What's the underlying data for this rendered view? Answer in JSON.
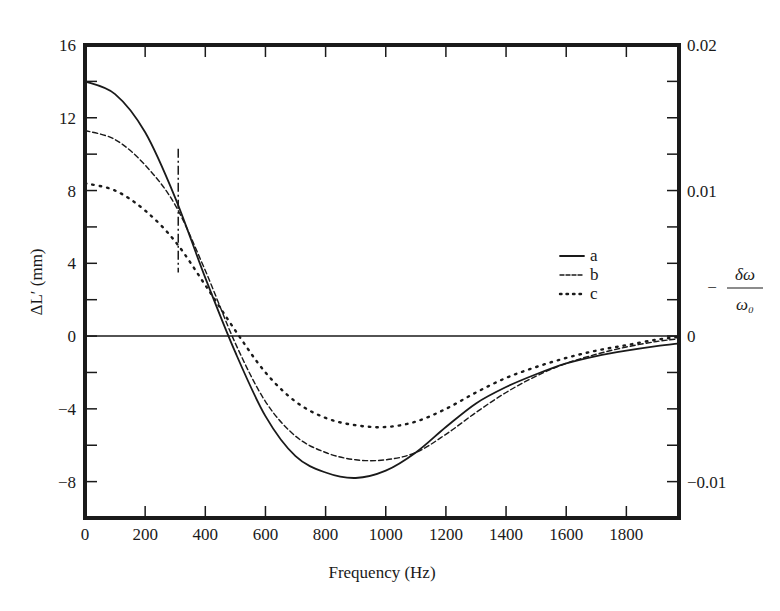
{
  "chart_data": {
    "type": "line",
    "title": "",
    "xlabel": "Frequency (Hz)",
    "ylabel": "ΔL′ (mm)",
    "ylabel_right": "−δω/ω₀",
    "ylabel_right_parts": {
      "sign": "−",
      "numerator": "δω",
      "denominator": "ω₀"
    },
    "xlim": [
      0,
      1975
    ],
    "ylim": [
      -10,
      16
    ],
    "ylim_right": [
      -0.0125,
      0.02
    ],
    "grid": false,
    "legend_position": "right-center",
    "x_ticks": [
      0,
      200,
      400,
      600,
      800,
      1000,
      1200,
      1400,
      1600,
      1800
    ],
    "x_tick_labels": [
      "0",
      "200",
      "400",
      "600",
      "800",
      "1000",
      "1200",
      "1400",
      "1600",
      "1800"
    ],
    "y_ticks_labeled": [
      16,
      12,
      8,
      4,
      0,
      -4,
      -8
    ],
    "y_tick_labels": [
      "16",
      "12",
      "8",
      "4",
      "0",
      "−4",
      "−8"
    ],
    "y_ticks_minor": [
      14,
      10,
      6,
      2,
      -2,
      -6,
      -10
    ],
    "y_right_ticks": [
      0.02,
      0.01,
      0,
      -0.01
    ],
    "y_right_tick_labels": [
      "0.02",
      "0.01",
      "0",
      "−0.01"
    ],
    "zero_line": true,
    "annotations": [
      {
        "type": "vertical-dash-dot-line",
        "x": 310,
        "y_from": 3.5,
        "y_to": 10.3
      }
    ],
    "series": [
      {
        "name": "a",
        "style": "solid",
        "x": [
          0,
          100,
          200,
          300,
          400,
          500,
          600,
          700,
          800,
          900,
          1000,
          1100,
          1200,
          1300,
          1400,
          1500,
          1600,
          1700,
          1800,
          1900,
          1975
        ],
        "y": [
          14.0,
          13.3,
          11.2,
          7.6,
          3.2,
          -0.9,
          -4.4,
          -6.6,
          -7.5,
          -7.8,
          -7.4,
          -6.4,
          -5.0,
          -3.7,
          -2.8,
          -2.1,
          -1.5,
          -1.1,
          -0.8,
          -0.55,
          -0.4
        ]
      },
      {
        "name": "b",
        "style": "dashed",
        "x": [
          0,
          100,
          200,
          300,
          400,
          500,
          600,
          700,
          800,
          900,
          1000,
          1100,
          1200,
          1300,
          1400,
          1500,
          1600,
          1700,
          1800,
          1900,
          1975
        ],
        "y": [
          11.3,
          10.8,
          9.4,
          7.2,
          3.6,
          -0.4,
          -3.6,
          -5.5,
          -6.4,
          -6.8,
          -6.8,
          -6.4,
          -5.4,
          -4.2,
          -3.1,
          -2.2,
          -1.5,
          -1.0,
          -0.6,
          -0.3,
          -0.15
        ]
      },
      {
        "name": "c",
        "style": "dotted",
        "x": [
          0,
          100,
          200,
          300,
          400,
          500,
          600,
          700,
          800,
          900,
          1000,
          1100,
          1200,
          1300,
          1400,
          1500,
          1600,
          1700,
          1800,
          1900,
          1975
        ],
        "y": [
          8.4,
          8.0,
          6.9,
          5.2,
          2.8,
          0.3,
          -2.0,
          -3.6,
          -4.5,
          -4.9,
          -5.0,
          -4.7,
          -4.0,
          -3.1,
          -2.3,
          -1.7,
          -1.2,
          -0.8,
          -0.5,
          -0.2,
          -0.05
        ]
      }
    ]
  }
}
